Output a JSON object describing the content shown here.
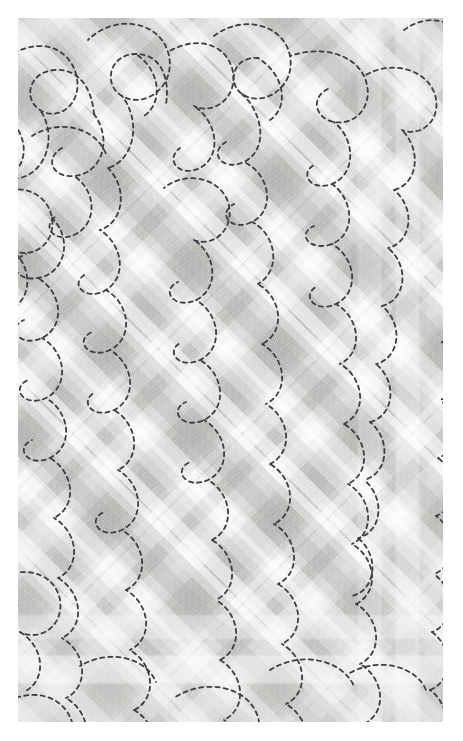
{
  "image": {
    "kind": "fabric-swatch",
    "subject": "quilted diagonal plaid cloth with free-motion meander stitching",
    "width": 463,
    "height": 741,
    "margin_px": 18,
    "panel": {
      "x": 18,
      "y": 18,
      "width": 425,
      "height": 704
    },
    "alt_text": "Close-up of pale grey quilted fabric printed with a soft diagonal plaid, stitched all over with a dashed meandering paisley quilting pattern."
  },
  "palette": {
    "page_background": "#ffffff",
    "cloth_base": "#d9d9d7",
    "plaid_light_band": "#ffffff",
    "plaid_dark_band": "#a9a9a7",
    "plaid_darkest_crossing": "#adadab",
    "plaid_brightest_crossing": "#fbfbfa",
    "stitch_thread": "#3c3c44",
    "weave_highlight": "#ffffff"
  },
  "plaid": {
    "type": "diagonal-gingham",
    "angle_degrees": 45,
    "repeat_px": 120,
    "down_bands": [
      {
        "offset": 6,
        "width": 20,
        "tone": "light",
        "alpha": 0.46
      },
      {
        "offset": 34,
        "width": 34,
        "tone": "dark",
        "alpha": 0.3
      },
      {
        "offset": 78,
        "width": 14,
        "tone": "light",
        "alpha": 0.62
      },
      {
        "offset": 100,
        "width": 26,
        "tone": "dark",
        "alpha": 0.22
      },
      {
        "offset": 136,
        "width": 22,
        "tone": "light",
        "alpha": 0.4
      },
      {
        "offset": 166,
        "width": 38,
        "tone": "dark",
        "alpha": 0.33
      },
      {
        "offset": 214,
        "width": 16,
        "tone": "light",
        "alpha": 0.58
      },
      {
        "offset": 238,
        "width": 28,
        "tone": "dark",
        "alpha": 0.24
      }
    ],
    "up_bands": [
      {
        "offset": 12,
        "width": 24,
        "tone": "light",
        "alpha": 0.44
      },
      {
        "offset": 46,
        "width": 32,
        "tone": "dark",
        "alpha": 0.3
      },
      {
        "offset": 88,
        "width": 16,
        "tone": "light",
        "alpha": 0.6
      },
      {
        "offset": 112,
        "width": 30,
        "tone": "dark",
        "alpha": 0.22
      },
      {
        "offset": 150,
        "width": 20,
        "tone": "light",
        "alpha": 0.42
      },
      {
        "offset": 180,
        "width": 36,
        "tone": "dark",
        "alpha": 0.33
      },
      {
        "offset": 226,
        "width": 14,
        "tone": "light",
        "alpha": 0.56
      },
      {
        "offset": 248,
        "width": 26,
        "tone": "dark",
        "alpha": 0.24
      }
    ]
  },
  "stitching": {
    "style": "free-motion meander / paisley",
    "thread_color": "#3c3c44",
    "stroke_width": 1.8,
    "dash_on": 4.2,
    "dash_off": 4.0,
    "linecap": "round",
    "motifs": [
      "teardrop-loop",
      "hook-curl",
      "s-meander",
      "spiral-curl"
    ],
    "paths": [
      "M-18,44 C18,16 50,28 58,56 C66,86 40,104 22,92 C4,80 12,54 36,52 C62,50 74,72 76,96",
      "M70,22 C96,-4 140,2 150,34 C160,66 128,92 104,78 C84,66 92,36 118,36 C144,36 152,62 148,86",
      "M150,34 C176,18 206,24 214,50 C222,78 196,98 176,88",
      "M196,18 C224,-4 266,6 272,38 C278,70 244,90 224,76 C208,64 216,38 240,40",
      "M272,38 C300,28 334,34 346,58 C358,84 340,108 316,104 C296,100 292,78 312,70",
      "M346,58 C372,42 406,50 416,74 C426,100 404,120 384,112",
      "M386,12 C410,-6 440,2 448,26",
      "M-14,96 C14,118 10,150 -12,160",
      "M22,92 C40,118 28,154 2,160 C-20,166 -34,144 -18,130",
      "M76,96 C96,124 82,156 56,158 C34,160 26,140 44,130",
      "M104,78 C124,104 116,142 90,150",
      "M176,88 C200,104 204,138 182,150 C162,160 146,142 162,130",
      "M224,76 C246,96 250,132 226,144 C204,154 190,134 208,124",
      "M316,104 C338,122 338,156 314,166 C292,174 280,154 298,146",
      "M384,112 C404,132 400,166 376,172",
      "M440,92 C458,110 454,142 432,150",
      "M-20,176 C4,164 30,176 34,200 C38,226 14,242 -6,232",
      "M56,158 C78,172 80,204 58,216 C38,226 22,210 38,198",
      "M90,150 C110,170 106,204 82,212",
      "M146,170 C168,152 202,160 210,184 C218,210 196,230 176,222",
      "M226,144 C252,156 258,192 234,204 C214,214 198,196 216,186",
      "M314,166 C336,182 338,216 314,226 C292,234 278,216 296,208",
      "M376,172 C398,190 394,224 370,230",
      "M432,150 C452,166 450,200 428,208",
      "M34,200 C56,222 46,256 20,260 C-2,264 -12,244 8,236",
      "M82,212 C104,226 110,258 88,272 C68,284 50,266 68,256",
      "M176,222 C198,236 202,270 178,282 C156,292 142,272 160,264",
      "M234,204 C258,216 264,252 240,266",
      "M314,226 C338,240 342,274 318,286 C296,296 282,276 300,268",
      "M370,230 C392,248 388,282 364,288",
      "M428,208 C450,224 448,258 426,266",
      "M-6,232 C16,250 14,284 -10,292",
      "M20,260 C44,274 48,308 24,320 C2,330 -12,310 6,302",
      "M88,272 C112,286 116,320 92,332 C70,342 56,322 74,314",
      "M178,282 C202,296 206,330 182,342 C160,352 146,332 164,324",
      "M240,266 C264,280 268,314 244,326",
      "M318,286 C342,300 346,334 322,346",
      "M364,288 C386,306 382,340 358,346",
      "M426,266 C448,282 446,316 424,324",
      "M24,320 C48,334 52,368 28,380 C6,390 -8,370 10,362",
      "M92,332 C116,346 120,380 96,392 C74,402 60,382 78,374",
      "M182,342 C206,356 210,390 186,402 C164,412 150,392 168,384",
      "M244,326 C268,340 272,374 248,386",
      "M322,346 C346,360 350,394 326,406",
      "M358,346 C380,364 376,398 352,404",
      "M424,324 C446,340 444,374 422,382",
      "M28,380 C52,394 56,428 32,440 C10,450 -4,430 14,422",
      "M96,392 C120,406 124,440 100,452",
      "M186,402 C210,416 214,450 190,462 C168,472 154,452 172,444",
      "M248,386 C272,400 276,434 252,446",
      "M326,406 C350,420 354,454 330,466",
      "M352,404 C374,422 370,456 346,462",
      "M422,382 C444,398 442,432 420,440",
      "M32,440 C56,454 60,488 36,500",
      "M100,452 C124,466 128,500 104,512 C82,522 68,502 86,494",
      "M190,462 C214,476 218,510 194,522",
      "M252,446 C276,460 280,494 256,506",
      "M330,466 C354,480 358,514 334,526",
      "M346,462 C368,480 364,514 340,520",
      "M420,440 C442,456 440,490 418,498",
      "M36,500 C60,514 64,548 40,560",
      "M104,512 C128,526 132,560 108,572",
      "M194,522 C218,536 222,570 198,582",
      "M256,506 C280,520 284,554 260,566",
      "M334,526 C358,540 362,574 338,586",
      "M340,520 C362,538 358,572 334,578",
      "M418,498 C440,514 438,548 416,556",
      "M-16,560 C10,546 38,558 42,582 C46,608 22,624 2,614",
      "M40,560 C64,574 68,608 44,620",
      "M108,572 C132,586 136,620 112,632",
      "M198,582 C222,596 226,630 202,642",
      "M260,566 C284,580 288,614 264,626",
      "M338,586 C362,600 366,634 342,646",
      "M416,556 C438,572 436,606 414,614",
      "M2,614 C26,628 30,662 6,674",
      "M44,620 C68,634 72,668 48,680",
      "M112,632 C136,646 140,680 116,692",
      "M202,642 C226,656 230,690 206,702",
      "M264,626 C288,640 292,674 268,686",
      "M342,646 C366,660 370,694 346,706",
      "M414,614 C436,630 434,664 412,672",
      "M-14,686 C14,668 46,678 54,704 C60,726 40,740 22,732",
      "M48,680 C72,694 76,726 54,738",
      "M116,692 C140,706 144,738 120,750",
      "M206,702 C230,716 234,748 210,760",
      "M268,686 C292,700 296,732 272,744",
      "M346,706 C370,720 374,752 350,764",
      "M412,672 C434,688 432,720 410,728",
      "M156,680 C186,660 226,668 238,694 C250,720 226,742 202,736",
      "M252,652 C284,632 324,642 336,668",
      "M62,648 C92,630 128,640 138,664",
      "M330,656 C360,638 398,648 408,672",
      "M14,118 C42,100 78,110 88,136",
      "M240,40 C266,56 272,88 252,102",
      "M118,36 C142,52 146,84 126,98"
    ]
  }
}
